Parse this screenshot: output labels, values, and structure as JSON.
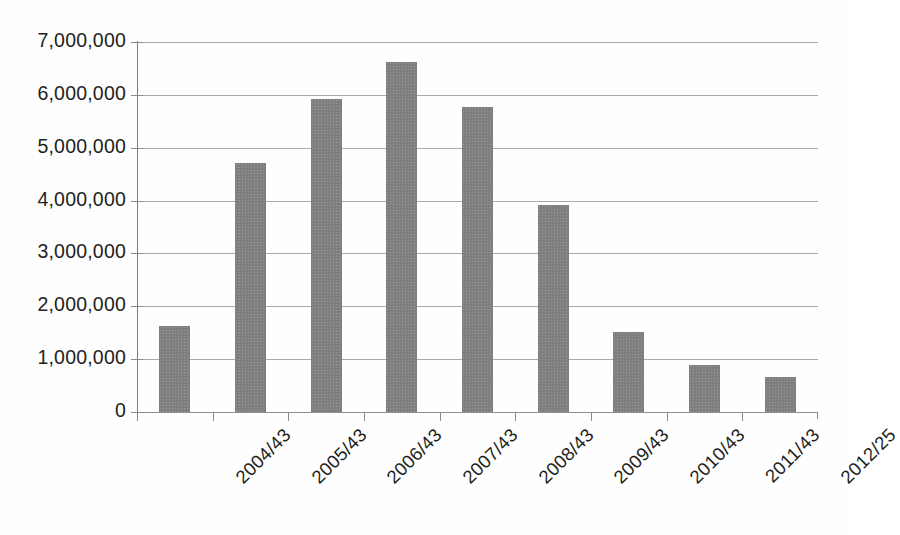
{
  "chart_data": {
    "type": "bar",
    "title": "",
    "subtitle": "",
    "xlabel": "",
    "ylabel": "",
    "categories": [
      "2004/43",
      "2005/43",
      "2006/43",
      "2007/43",
      "2008/43",
      "2009/43",
      "2010/43",
      "2011/43",
      "2012/25"
    ],
    "values": [
      1620000,
      4720000,
      5920000,
      6620000,
      5780000,
      3920000,
      1520000,
      890000,
      660000
    ],
    "ylim": [
      0,
      7000000
    ],
    "ytick_values": [
      0,
      1000000,
      2000000,
      3000000,
      4000000,
      5000000,
      6000000,
      7000000
    ],
    "ytick_labels": [
      "0",
      "1,000,000",
      "2,000,000",
      "3,000,000",
      "4,000,000",
      "5,000,000",
      "6,000,000",
      "7,000,000"
    ],
    "grid": true,
    "legend": false,
    "legend_position": "none",
    "series": [
      {
        "name": "",
        "color": "#7f7f7f",
        "values": [
          1620000,
          4720000,
          5920000,
          6620000,
          5780000,
          3920000,
          1520000,
          890000,
          660000
        ]
      }
    ]
  },
  "colors": {
    "bar": "#7f7f7f",
    "gridline": "#9b9b9b",
    "axis": "#7d7d7d",
    "text": "#231f20",
    "background": "#ffffff"
  }
}
